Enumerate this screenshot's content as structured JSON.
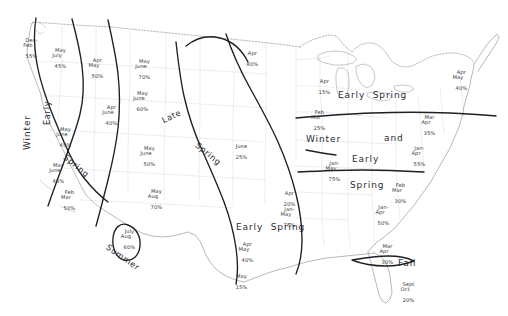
{
  "map": {
    "title": "United States Seasonal Precipitation Map",
    "background_color": "#ffffff",
    "state_border_color": "#b9b9c2",
    "coast_color": "#9a9aa4",
    "region_boundary_color": "#1f1f24",
    "label_color": "#3a3a40"
  },
  "region_labels": [
    {
      "id": "winter",
      "text": "Winter",
      "orientation": "vertical"
    },
    {
      "id": "early",
      "text": "Early",
      "orientation": "vertical"
    },
    {
      "id": "spring-west",
      "text": "Spring",
      "orientation": "diagonal"
    },
    {
      "id": "summer",
      "text": "Summer",
      "orientation": "diagonal"
    },
    {
      "id": "late",
      "text": "Late",
      "orientation": "diagonal"
    },
    {
      "id": "spring-central",
      "text": "Spring",
      "orientation": "diagonal"
    },
    {
      "id": "early-spring-sc",
      "text": "Early  Spring",
      "orientation": "horizontal"
    },
    {
      "id": "early-spring-lakes",
      "text": "Early  Spring",
      "orientation": "horizontal"
    },
    {
      "id": "winter-east",
      "text": "Winter",
      "orientation": "horizontal"
    },
    {
      "id": "and",
      "text": "and",
      "orientation": "horizontal"
    },
    {
      "id": "early-se",
      "text": "Early",
      "orientation": "horizontal"
    },
    {
      "id": "spring-se",
      "text": "Spring",
      "orientation": "horizontal"
    },
    {
      "id": "fall",
      "text": "Fall",
      "orientation": "horizontal"
    }
  ],
  "data_labels": [
    {
      "id": "pacific-nw-coast",
      "months": "Dec-\nFeb",
      "percent": "55%"
    },
    {
      "id": "washington",
      "months": "May\nJuly",
      "percent": "45%"
    },
    {
      "id": "oregon-idaho",
      "months": "Apr\nMay",
      "percent": "50%"
    },
    {
      "id": "montana",
      "months": "May\nJune",
      "percent": "70%"
    },
    {
      "id": "wyoming",
      "months": "May\nJune",
      "percent": "60%"
    },
    {
      "id": "nevada-north",
      "months": "May\nJune",
      "percent": "45%"
    },
    {
      "id": "utah-colorado",
      "months": "Apr\nJune",
      "percent": "40%"
    },
    {
      "id": "california-central",
      "months": "May\nJune",
      "percent": "45%"
    },
    {
      "id": "california-south",
      "months": "Feb\nMar",
      "percent": "50%"
    },
    {
      "id": "colorado-kansas",
      "months": "May\nJune",
      "percent": "50%"
    },
    {
      "id": "new-mexico",
      "months": "May\nAug",
      "percent": "70%"
    },
    {
      "id": "arizona",
      "months": "July\nAug",
      "percent": "60%"
    },
    {
      "id": "minnesota",
      "months": "Apr",
      "percent": "80%"
    },
    {
      "id": "nebraska-iowa",
      "months": "June",
      "percent": "25%"
    },
    {
      "id": "michigan",
      "months": "Apr",
      "percent": "15%"
    },
    {
      "id": "ohio-valley",
      "months": "Feb\nMar",
      "percent": "25%"
    },
    {
      "id": "missouri",
      "months": "Apr",
      "percent": "20%"
    },
    {
      "id": "arkansas",
      "months": "Jan-\nMay",
      "percent": "75%"
    },
    {
      "id": "texas-north",
      "months": "Apr\nMay",
      "percent": "40%"
    },
    {
      "id": "texas-south",
      "months": "May",
      "percent": "15%"
    },
    {
      "id": "tennessee",
      "months": "Jan-\nMay",
      "percent": "75%"
    },
    {
      "id": "alabama",
      "months": "Jan-\nApr",
      "percent": "50%"
    },
    {
      "id": "carolina",
      "months": "Feb\nMar",
      "percent": "30%"
    },
    {
      "id": "virginia",
      "months": "Jan-\nApr",
      "percent": "55%"
    },
    {
      "id": "mid-atlantic",
      "months": "Mar\nApr",
      "percent": "35%"
    },
    {
      "id": "northeast",
      "months": "Apr\nMay",
      "percent": "40%"
    },
    {
      "id": "georgia",
      "months": "Mar\nApr",
      "percent": "30%"
    },
    {
      "id": "florida",
      "months": "Sept\nOct",
      "percent": "20%"
    }
  ]
}
